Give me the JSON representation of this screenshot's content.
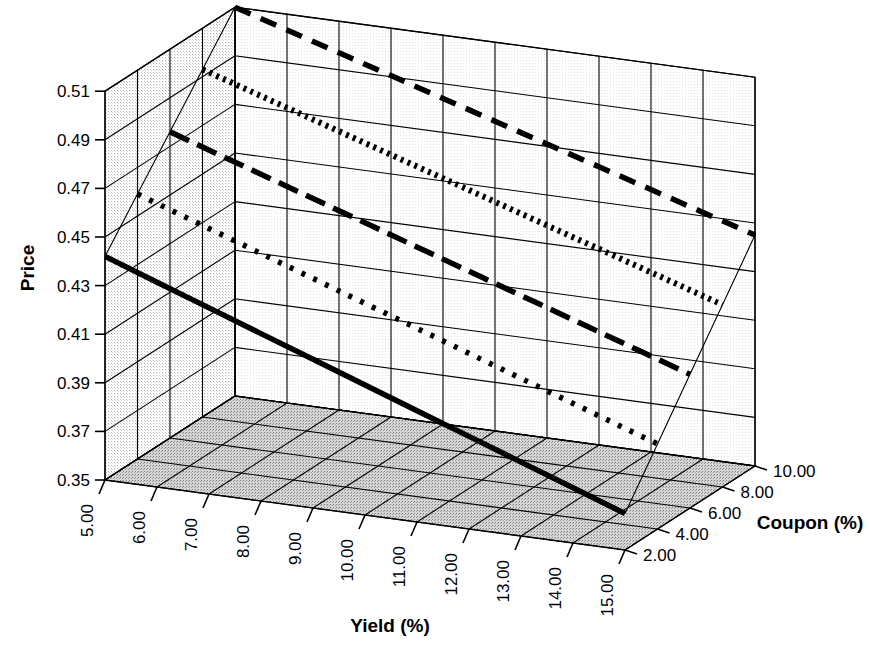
{
  "chart_data": {
    "type": "line",
    "render": "3d-wireframe-surface",
    "title": "",
    "xlabel": "Yield (%)",
    "ylabel": "Price",
    "zlabel": "Coupon (%)",
    "x": [
      5.0,
      6.0,
      7.0,
      8.0,
      9.0,
      10.0,
      11.0,
      12.0,
      13.0,
      14.0,
      15.0
    ],
    "xticklabels": [
      "5.00",
      "6.00",
      "7.00",
      "8.00",
      "9.00",
      "10.00",
      "11.00",
      "12.00",
      "13.00",
      "14.00",
      "15.00"
    ],
    "yticklabels": [
      "0.35",
      "0.37",
      "0.39",
      "0.41",
      "0.43",
      "0.45",
      "0.47",
      "0.49",
      "0.51"
    ],
    "ylim": [
      0.35,
      0.51
    ],
    "ytick_step": 0.02,
    "z": [
      2.0,
      4.0,
      6.0,
      8.0,
      10.0
    ],
    "zticklabels": [
      "2.00",
      "4.00",
      "6.00",
      "8.00",
      "10.00"
    ],
    "grid": true,
    "legend": "none",
    "series": [
      {
        "name": "Coupon 10.00%",
        "z": 10.0,
        "style": "dashed",
        "values": [
          0.51,
          0.5035,
          0.497,
          0.4905,
          0.484,
          0.4775,
          0.471,
          0.4645,
          0.458,
          0.4515,
          0.445
        ]
      },
      {
        "name": "Coupon 8.00%",
        "z": 8.0,
        "style": "fine-dotted",
        "values": [
          0.493,
          0.4862,
          0.4794,
          0.4726,
          0.4658,
          0.459,
          0.4522,
          0.4454,
          0.4386,
          0.4318,
          0.425
        ]
      },
      {
        "name": "Coupon 6.00%",
        "z": 6.0,
        "style": "dash-dot",
        "values": [
          0.476,
          0.4689,
          0.4618,
          0.4547,
          0.4476,
          0.4405,
          0.4334,
          0.4263,
          0.4192,
          0.4121,
          0.405
        ]
      },
      {
        "name": "Coupon 4.00%",
        "z": 4.0,
        "style": "dotted",
        "values": [
          0.459,
          0.4516,
          0.4442,
          0.4368,
          0.4294,
          0.422,
          0.4146,
          0.4072,
          0.3998,
          0.3924,
          0.385
        ]
      },
      {
        "name": "Coupon 2.00%",
        "z": 2.0,
        "style": "solid",
        "values": [
          0.442,
          0.4343,
          0.4266,
          0.4189,
          0.4112,
          0.4035,
          0.3958,
          0.3881,
          0.3804,
          0.3727,
          0.365
        ]
      }
    ],
    "colors": {
      "line": "#000000",
      "grid": "#000000",
      "wall_left": "#e8e8e8",
      "wall_back": "#ffffff",
      "floor": "#c9c9c9",
      "background": "#ffffff"
    }
  },
  "axes": {
    "price": {
      "label": "Price",
      "ticks": [
        "0.51",
        "0.49",
        "0.47",
        "0.45",
        "0.43",
        "0.41",
        "0.39",
        "0.37",
        "0.35"
      ]
    },
    "yield": {
      "label": "Yield (%)",
      "ticks": [
        "5.00",
        "6.00",
        "7.00",
        "8.00",
        "9.00",
        "10.00",
        "11.00",
        "12.00",
        "13.00",
        "14.00",
        "15.00"
      ]
    },
    "coupon": {
      "label": "Coupon (%)",
      "ticks": [
        "10.00",
        "8.00",
        "6.00",
        "4.00",
        "2.00"
      ]
    }
  }
}
